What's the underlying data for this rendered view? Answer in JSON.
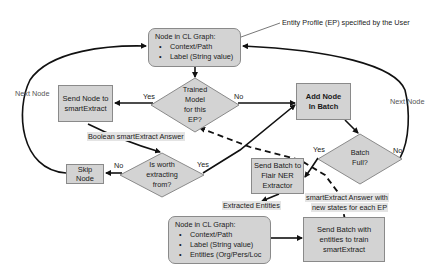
{
  "nodes": {
    "top_node": {
      "title": "Node in CL Graph:",
      "items": [
        "Context/Path",
        "Label (String value)"
      ]
    },
    "trained_model_decision": {
      "line1": "Trained",
      "line2": "Model",
      "line3": "for this",
      "line4": "EP?"
    },
    "send_node_smartextract": {
      "line1": "Send Node to",
      "line2": "smartExtract"
    },
    "add_node_batch": {
      "line1": "Add Node",
      "line2": "In Batch"
    },
    "batch_full_decision": {
      "line1": "Batch",
      "line2": "Full?"
    },
    "worth_extracting_decision": {
      "line1": "Is worth",
      "line2": "extracting",
      "line3": "from?"
    },
    "skip_node": {
      "line1": "Skip",
      "line2": "Node"
    },
    "send_batch_flair": {
      "line1": "Send Batch to",
      "line2": "Flair NER",
      "line3": "Extractor"
    },
    "bottom_node": {
      "title": "Node in CL Graph:",
      "items": [
        "Context/Path",
        "Label (String value)",
        "Entities (Org/Pers/Loc"
      ]
    },
    "send_batch_train": {
      "line1": "Send Batch with",
      "line2": "entities to train",
      "line3": "smartExtract"
    }
  },
  "labels": {
    "entity_profile_note": "Entity Profile (EP) specified by the User",
    "next_node_left": "Next Node",
    "next_node_right": "Next Node",
    "yes_trained": "Yes",
    "no_trained": "No",
    "boolean_answer": "Boolean smartExtract Answer",
    "no_worth": "No",
    "yes_worth": "Yes",
    "yes_batch": "Yes",
    "no_batch": "No",
    "extracted_entities": "Extracted Entities",
    "smartextract_answer_line1": "smartExtract Answer with",
    "smartextract_answer_line2": "new states for each EP"
  },
  "colors": {
    "box_fill": "#d3d3d3",
    "box_border": "#8a8a8a",
    "line": "#111111",
    "label_highlight": "#e4e4e4"
  }
}
